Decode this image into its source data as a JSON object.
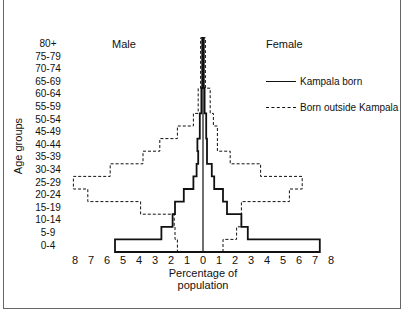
{
  "chart_data": {
    "type": "bar",
    "subtype": "population-pyramid-step",
    "title": "",
    "xlabel": "Percentage of population",
    "ylabel": "Age groups",
    "side_labels": {
      "left": "Male",
      "right": "Female"
    },
    "x_ticks_left": [
      "8",
      "7",
      "6",
      "5",
      "4",
      "3",
      "2",
      "1"
    ],
    "x_ticks_right": [
      "0",
      "1",
      "2",
      "3",
      "4",
      "5",
      "6",
      "7",
      "8"
    ],
    "xlim": [
      -8,
      8
    ],
    "grid": false,
    "legend_position": "upper right",
    "categories": [
      "0-4",
      "5-9",
      "10-14",
      "15-19",
      "20-24",
      "25-29",
      "30-34",
      "35-39",
      "40-44",
      "45-49",
      "50-54",
      "55-59",
      "60-64",
      "65-69",
      "70-74",
      "75-79",
      "80+"
    ],
    "categories_top_to_bottom": [
      "80+",
      "75-79",
      "70-74",
      "65-69",
      "60-64",
      "55-59",
      "50-54",
      "45-49",
      "40-44",
      "35-39",
      "30-34",
      "25-29",
      "20-24",
      "15-19",
      "10-14",
      "5-9",
      "0-4"
    ],
    "series": [
      {
        "name": "Kampala born",
        "style": "solid",
        "sex": "Male",
        "values": [
          5.5,
          2.6,
          1.9,
          1.75,
          1.2,
          0.6,
          0.4,
          0.3,
          0.35,
          0.2,
          0.2,
          0.1,
          0.1,
          0.05,
          0.05,
          0.05,
          0.05
        ]
      },
      {
        "name": "Kampala born",
        "style": "solid",
        "sex": "Female",
        "values": [
          7.3,
          2.8,
          2.4,
          1.5,
          1.25,
          0.7,
          0.55,
          0.25,
          0.25,
          0.2,
          0.2,
          0.1,
          0.1,
          0.05,
          0.05,
          0.05,
          0.05
        ]
      },
      {
        "name": "Born outside Kampala",
        "style": "dashed",
        "sex": "Male",
        "values": [
          1.6,
          1.75,
          1.8,
          3.9,
          7.2,
          8.1,
          5.8,
          3.75,
          2.7,
          1.6,
          0.6,
          0.3,
          0.3,
          0.15,
          0.15,
          0.15,
          0.15
        ]
      },
      {
        "name": "Born outside Kampala",
        "style": "dashed",
        "sex": "Female",
        "values": [
          1.25,
          2.1,
          2.4,
          2.4,
          5.4,
          6.2,
          3.6,
          1.7,
          0.9,
          0.9,
          0.65,
          0.45,
          0.45,
          0.15,
          0.15,
          0.15,
          0.15
        ]
      }
    ]
  },
  "legend": {
    "solid_label": "Kampala born",
    "dashed_label": "Born outside Kampala"
  },
  "colors": {
    "line": "#111111",
    "background": "#ffffff"
  }
}
